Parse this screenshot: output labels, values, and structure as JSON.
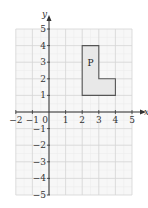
{
  "diagram": {
    "type": "coordinate-grid",
    "x_axis": {
      "label": "x",
      "min": -2,
      "max": 5,
      "ticks": [
        "-2",
        "-1",
        "0",
        "1",
        "2",
        "3",
        "4",
        "5"
      ]
    },
    "y_axis": {
      "label": "y",
      "min": -5,
      "max": 5,
      "ticks": [
        "5",
        "4",
        "3",
        "2",
        "1",
        "-1",
        "-2",
        "-3",
        "-4",
        "-5"
      ]
    },
    "shape": {
      "label": "P",
      "vertices": [
        [
          2,
          1
        ],
        [
          2,
          4
        ],
        [
          3,
          4
        ],
        [
          3,
          2
        ],
        [
          4,
          2
        ],
        [
          4,
          1
        ]
      ],
      "fill": "#e8e8e8",
      "stroke": "#555555"
    },
    "colors": {
      "grid_major": "#d4d4d4",
      "grid_minor": "#ececec",
      "axis": "#333333",
      "bg": "#f7f7f7"
    }
  }
}
